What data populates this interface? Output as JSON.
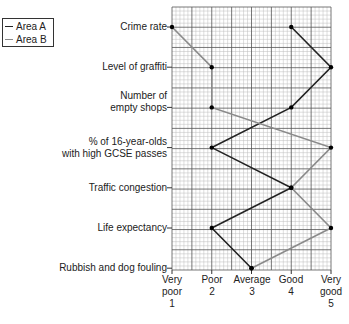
{
  "chart_data": {
    "type": "line",
    "orientation": "horizontal-profile",
    "title": "",
    "xlabel": "",
    "ylabel": "",
    "xlim": [
      1,
      5
    ],
    "grid": true,
    "legend_position": "top-left",
    "categories": [
      "Crime rate",
      "Level of graffiti",
      "Number of empty shops",
      "% of 16-year-olds with high GCSE passes",
      "Traffic congestion",
      "Life expectancy",
      "Rubbish and dog fouling"
    ],
    "x_ticks": [
      {
        "value": 1,
        "label": [
          "Very",
          "poor",
          "1"
        ]
      },
      {
        "value": 2,
        "label": [
          "Poor",
          "2"
        ]
      },
      {
        "value": 3,
        "label": [
          "Average",
          "3"
        ]
      },
      {
        "value": 4,
        "label": [
          "Good",
          "4"
        ]
      },
      {
        "value": 5,
        "label": [
          "Very",
          "good",
          "5"
        ]
      }
    ],
    "series": [
      {
        "name": "Area A",
        "color": "#222222",
        "values": [
          4,
          5,
          4,
          2,
          4,
          2,
          3
        ]
      },
      {
        "name": "Area B",
        "color": "#8a8a8a",
        "values": [
          1,
          2,
          2,
          5,
          4,
          5,
          3
        ]
      }
    ]
  },
  "legend": {
    "items": [
      {
        "label": "Area A",
        "color": "#222222"
      },
      {
        "label": "Area B",
        "color": "#8a8a8a"
      }
    ]
  },
  "labels": {
    "cat0": [
      "Crime rate"
    ],
    "cat1": [
      "Level of graffiti"
    ],
    "cat2": [
      "Number of",
      "empty shops"
    ],
    "cat3": [
      "% of 16-year-olds",
      "with high GCSE passes"
    ],
    "cat4": [
      "Traffic congestion"
    ],
    "cat5": [
      "Life expectancy"
    ],
    "cat6": [
      "Rubbish and dog fouling"
    ],
    "x0": [
      "Very",
      "poor",
      "1"
    ],
    "x1": [
      "Poor",
      "2"
    ],
    "x2": [
      "Average",
      "3"
    ],
    "x3": [
      "Good",
      "4"
    ],
    "x4": [
      "Very",
      "good",
      "5"
    ]
  }
}
